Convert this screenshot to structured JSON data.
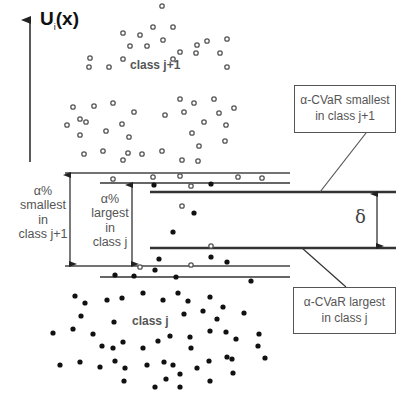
{
  "diagram": {
    "axis": {
      "title_main": "U",
      "title_sub": "i",
      "title_tail": "(x)"
    },
    "classes": {
      "upper_label": "class j+1",
      "lower_label": "class j"
    },
    "side_labels": {
      "outer": [
        "α%",
        "smallest",
        "in",
        "class j+1"
      ],
      "inner": [
        "α%",
        "largest",
        "in",
        "class j"
      ]
    },
    "boxes": {
      "top": {
        "line1": "α-CVaR smallest",
        "line2": "in class j+1"
      },
      "bottom": {
        "line1": "α-CVaR largest",
        "line2": "in class j"
      }
    },
    "delta_symbol": "δ",
    "colors": {
      "open_marker": "#555555",
      "filled_marker": "#111111",
      "text": "#555555",
      "lines": "#333333"
    },
    "points": {
      "class_j_plus_1_open": [
        [
          153,
          27
        ],
        [
          173,
          27
        ],
        [
          123,
          33
        ],
        [
          140,
          35
        ],
        [
          207,
          41
        ],
        [
          130,
          46
        ],
        [
          163,
          40
        ],
        [
          197,
          45
        ],
        [
          90,
          58
        ],
        [
          227,
          39
        ],
        [
          196,
          53
        ],
        [
          123,
          59
        ],
        [
          180,
          52
        ],
        [
          109,
          67
        ],
        [
          89,
          67
        ],
        [
          173,
          59
        ],
        [
          220,
          53
        ],
        [
          227,
          67
        ],
        [
          147,
          46
        ],
        [
          73,
          107
        ],
        [
          94,
          106
        ],
        [
          113,
          103
        ],
        [
          180,
          99
        ],
        [
          194,
          103
        ],
        [
          214,
          99
        ],
        [
          234,
          108
        ],
        [
          134,
          112
        ],
        [
          165,
          115
        ],
        [
          184,
          112
        ],
        [
          219,
          113
        ],
        [
          67,
          125
        ],
        [
          80,
          119
        ],
        [
          86,
          122
        ],
        [
          122,
          124
        ],
        [
          204,
          122
        ],
        [
          226,
          125
        ],
        [
          80,
          135
        ],
        [
          106,
          131
        ],
        [
          192,
          133
        ],
        [
          129,
          137
        ],
        [
          225,
          141
        ],
        [
          199,
          146
        ],
        [
          84,
          154
        ],
        [
          103,
          151
        ],
        [
          128,
          153
        ],
        [
          142,
          154
        ],
        [
          162,
          151
        ],
        [
          123,
          160
        ],
        [
          182,
          160
        ],
        [
          198,
          161
        ],
        [
          113,
          179
        ],
        [
          153,
          177
        ],
        [
          180,
          176
        ],
        [
          238,
          177
        ],
        [
          262,
          178
        ],
        [
          191,
          186
        ],
        [
          182,
          206
        ],
        [
          211,
          246
        ],
        [
          140,
          267
        ],
        [
          191,
          265
        ],
        [
          162,
          6
        ]
      ],
      "class_j_filled": [
        [
          154,
          185
        ],
        [
          211,
          184
        ],
        [
          194,
          213
        ],
        [
          173,
          232
        ],
        [
          159,
          259
        ],
        [
          211,
          257
        ],
        [
          227,
          262
        ],
        [
          251,
          281
        ],
        [
          115,
          275
        ],
        [
          134,
          276
        ],
        [
          155,
          270
        ],
        [
          176,
          277
        ],
        [
          75,
          296
        ],
        [
          85,
          303
        ],
        [
          107,
          300
        ],
        [
          122,
          298
        ],
        [
          143,
          293
        ],
        [
          163,
          300
        ],
        [
          178,
          293
        ],
        [
          188,
          301
        ],
        [
          210,
          297
        ],
        [
          223,
          307
        ],
        [
          81,
          316
        ],
        [
          114,
          322
        ],
        [
          184,
          314
        ],
        [
          203,
          311
        ],
        [
          217,
          319
        ],
        [
          244,
          313
        ],
        [
          53,
          333
        ],
        [
          73,
          329
        ],
        [
          93,
          334
        ],
        [
          102,
          346
        ],
        [
          123,
          342
        ],
        [
          158,
          341
        ],
        [
          170,
          336
        ],
        [
          190,
          337
        ],
        [
          191,
          348
        ],
        [
          210,
          331
        ],
        [
          226,
          332
        ],
        [
          236,
          339
        ],
        [
          258,
          346
        ],
        [
          259,
          334
        ],
        [
          143,
          348
        ],
        [
          113,
          348
        ],
        [
          60,
          365
        ],
        [
          80,
          362
        ],
        [
          100,
          367
        ],
        [
          115,
          361
        ],
        [
          125,
          368
        ],
        [
          147,
          365
        ],
        [
          164,
          362
        ],
        [
          173,
          365
        ],
        [
          197,
          368
        ],
        [
          180,
          374
        ],
        [
          209,
          361
        ],
        [
          232,
          359
        ],
        [
          233,
          373
        ],
        [
          227,
          357
        ],
        [
          265,
          358
        ],
        [
          124,
          381
        ],
        [
          155,
          387
        ],
        [
          166,
          379
        ],
        [
          180,
          387
        ],
        [
          210,
          381
        ]
      ]
    }
  }
}
